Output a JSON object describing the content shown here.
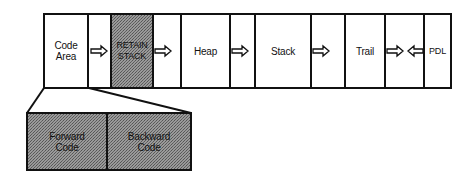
{
  "diagram": {
    "memory_areas": [
      {
        "id": "code",
        "label_line1": "Code",
        "label_line2": "Area",
        "shaded": false
      },
      {
        "id": "retain",
        "label_line1": "RETAIN",
        "label_line2": "STACK",
        "shaded": true
      },
      {
        "id": "heap",
        "label": "Heap",
        "shaded": false
      },
      {
        "id": "stack",
        "label": "Stack",
        "shaded": false
      },
      {
        "id": "trail",
        "label": "Trail",
        "shaded": false
      },
      {
        "id": "pdl",
        "label": "PDL",
        "shaded": false
      }
    ],
    "code_area_detail": [
      {
        "id": "forward",
        "label_line1": "Forward",
        "label_line2": "Code"
      },
      {
        "id": "backward",
        "label_line1": "Backward",
        "label_line2": "Code"
      }
    ],
    "arrows": [
      {
        "from": "code",
        "to": "retain",
        "direction": "right"
      },
      {
        "from": "retain",
        "to": "heap",
        "direction": "right"
      },
      {
        "from": "heap",
        "to": "stack",
        "direction": "right"
      },
      {
        "from": "stack",
        "to": "trail",
        "direction": "right"
      },
      {
        "from": "trail",
        "direction": "right"
      },
      {
        "from": "pdl",
        "direction": "left"
      }
    ],
    "colors": {
      "line": "#111111",
      "shade": "#8a8a8a",
      "background": "#ffffff"
    }
  }
}
